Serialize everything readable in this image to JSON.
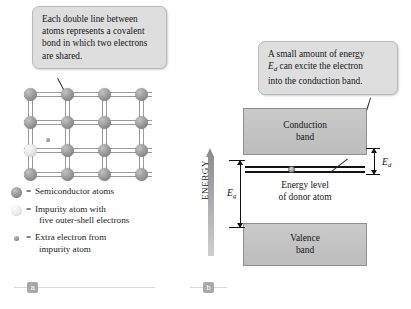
{
  "figure": {
    "panels": [
      {
        "id": "a",
        "label": "a"
      },
      {
        "id": "b",
        "label": "b"
      }
    ]
  },
  "panel_a": {
    "callout": {
      "line1": "Each double line between",
      "line2": "atoms represents a covalent",
      "line3": "bond in which two electrons",
      "line4": "are shared."
    },
    "lattice": {
      "rows": 4,
      "cols": 4,
      "impurity_position": {
        "row": 3,
        "col": 1
      },
      "inner_label": "a"
    },
    "legend": [
      {
        "key": "semiconductor-atom",
        "eq": "=",
        "text": "Semiconductor atoms"
      },
      {
        "key": "impurity-atom",
        "eq": "=",
        "text": "Impurity atom with\nfive outer-shell electrons"
      },
      {
        "key": "extra-electron",
        "eq": "=",
        "text": "Extra electron from\nimpurity atom"
      }
    ],
    "legend_lines": {
      "semiconductor": "Semiconductor atoms",
      "impurity_1": "Impurity atom with",
      "impurity_2": "five outer-shell electrons",
      "electron_1": "Extra electron from",
      "electron_2": "impurity atom"
    }
  },
  "panel_b": {
    "callout": {
      "pre": "A small amount of energy",
      "symbol": "E",
      "subscript": "d",
      "mid": " can excite the electron",
      "post": "into the conduction band."
    },
    "axis": {
      "label": "ENERGY",
      "direction": "up"
    },
    "bands": {
      "conduction": {
        "line1": "Conduction",
        "line2": "band"
      },
      "valence": {
        "line1": "Valence",
        "line2": "band"
      }
    },
    "donor_level": {
      "line1": "Energy level",
      "line2": "of donor atom"
    },
    "dimensions": [
      {
        "name": "band-gap",
        "symbol": "E",
        "subscript": "g"
      },
      {
        "name": "donor-ionization-energy",
        "symbol": "E",
        "subscript": "d"
      }
    ],
    "dim_eg": {
      "symbol": "E",
      "subscript": "g"
    },
    "dim_ed": {
      "symbol": "E",
      "subscript": "d"
    }
  },
  "colors": {
    "callout_fill": "#dedede",
    "callout_border": "#b9b9b9",
    "band_fill": "#c4c4c4",
    "band_border": "#8f8f8f",
    "atom": "#9d9d9d",
    "impurity_atom": "#e6e6e6",
    "badge": "#a8a8a8",
    "line": "#111111"
  }
}
